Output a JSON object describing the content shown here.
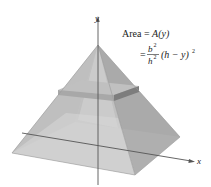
{
  "figure": {
    "type": "3d-pyramid-cross-section",
    "axes": {
      "x_label": "x",
      "y_label": "y"
    },
    "annotation": {
      "line1_prefix": "Area = ",
      "line1_func": "A(y)",
      "line2_eq": "=",
      "frac_num": "b",
      "frac_num_exp": "2",
      "frac_den": "h",
      "frac_den_exp": "2",
      "tail": "(h − y)",
      "tail_exp": "2"
    },
    "colors": {
      "face_left": "#b9b9b9",
      "face_front": "#d3d3d3",
      "face_right": "#a4a4a4",
      "face_back": "#c6c6c6",
      "slab_top": "#c2c2c2",
      "slab_side_left": "#a9a9a9",
      "slab_side_right": "#7e7e7e",
      "axis": "#555555"
    }
  }
}
